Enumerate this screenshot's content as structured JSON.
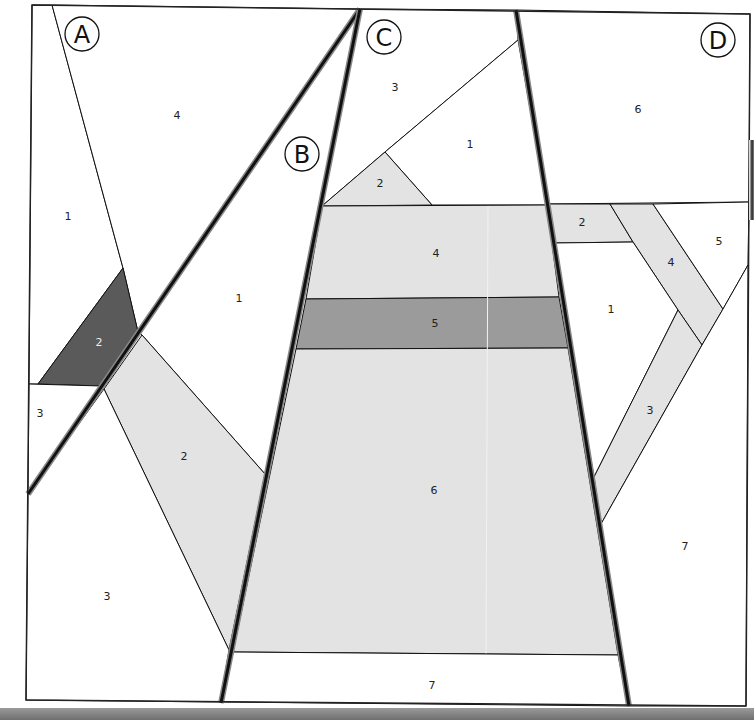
{
  "diagram": {
    "colors": {
      "white": "#ffffff",
      "light_gray": "#e3e3e3",
      "medium_gray": "#9b9b9b",
      "dark_gray": "#5a5a5a",
      "line": "#111111",
      "seam_shadow": "#777777"
    },
    "sections": [
      {
        "id": "A",
        "label": "A",
        "label_pos": [
          82,
          34
        ],
        "pieces": [
          {
            "num": "1",
            "fill": "white",
            "pos": [
              68,
              217
            ]
          },
          {
            "num": "2",
            "fill": "dark_gray",
            "pos": [
              99,
              343
            ]
          },
          {
            "num": "3",
            "fill": "white",
            "pos": [
              40,
              414
            ]
          },
          {
            "num": "4",
            "fill": "white",
            "pos": [
              177,
              116
            ]
          }
        ]
      },
      {
        "id": "B",
        "label": "B",
        "label_pos": [
          302,
          154
        ],
        "pieces": [
          {
            "num": "1",
            "fill": "white",
            "pos": [
              239,
              299
            ]
          },
          {
            "num": "2",
            "fill": "light_gray",
            "pos": [
              184,
              457
            ]
          },
          {
            "num": "3",
            "fill": "white",
            "pos": [
              107,
              597
            ]
          }
        ]
      },
      {
        "id": "C",
        "label": "C",
        "label_pos": [
          384,
          37
        ],
        "pieces": [
          {
            "num": "1",
            "fill": "white",
            "pos": [
              470,
              145
            ]
          },
          {
            "num": "2",
            "fill": "light_gray",
            "pos": [
              380,
              184
            ]
          },
          {
            "num": "3",
            "fill": "white",
            "pos": [
              395,
              88
            ]
          },
          {
            "num": "4",
            "fill": "light_gray",
            "pos": [
              436,
              254
            ]
          },
          {
            "num": "5",
            "fill": "medium_gray",
            "pos": [
              435,
              324
            ]
          },
          {
            "num": "6",
            "fill": "light_gray",
            "pos": [
              434,
              491
            ]
          },
          {
            "num": "7",
            "fill": "white",
            "pos": [
              432,
              686
            ]
          }
        ]
      },
      {
        "id": "D",
        "label": "D",
        "label_pos": [
          718,
          40
        ],
        "pieces": [
          {
            "num": "1",
            "fill": "white",
            "pos": [
              611,
              310
            ]
          },
          {
            "num": "2",
            "fill": "light_gray",
            "pos": [
              582,
              223
            ]
          },
          {
            "num": "3",
            "fill": "light_gray",
            "pos": [
              650,
              411
            ]
          },
          {
            "num": "4",
            "fill": "light_gray",
            "pos": [
              671,
              263
            ]
          },
          {
            "num": "5",
            "fill": "white",
            "pos": [
              719,
              242
            ]
          },
          {
            "num": "6",
            "fill": "white",
            "pos": [
              638,
              110
            ]
          },
          {
            "num": "7",
            "fill": "white",
            "pos": [
              685,
              547
            ]
          }
        ]
      }
    ]
  }
}
